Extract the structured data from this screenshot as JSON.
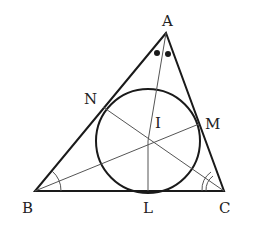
{
  "diagram": {
    "type": "geometry-incircle",
    "vertices": {
      "A": {
        "label": "A",
        "x": 166,
        "y": 33
      },
      "B": {
        "label": "B",
        "x": 35,
        "y": 191
      },
      "C": {
        "label": "C",
        "x": 224,
        "y": 191
      }
    },
    "incenter": {
      "label": "I",
      "x": 148,
      "y": 141
    },
    "incircle": {
      "cx": 148,
      "cy": 141,
      "r": 52
    },
    "tangent_points": {
      "L": {
        "label": "L",
        "x": 148,
        "y": 191
      },
      "M": {
        "label": "M",
        "x": 199,
        "y": 124
      },
      "N": {
        "label": "N",
        "x": 103,
        "y": 107
      }
    },
    "labels": {
      "A": "A",
      "B": "B",
      "C": "C",
      "I": "I",
      "L": "L",
      "M": "M",
      "N": "N"
    },
    "angle_marks": {
      "A": "two dots (bisected angle)",
      "B": "single arc",
      "C": "double arc"
    },
    "colors": {
      "stroke": "#1a1a1a",
      "thin_stroke": "#555555",
      "background": "#ffffff"
    }
  }
}
